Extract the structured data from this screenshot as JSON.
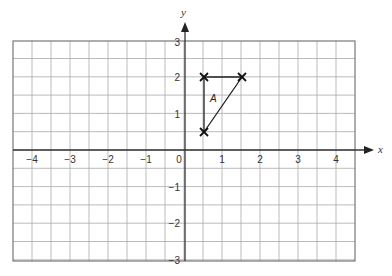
{
  "diagram": {
    "title": "",
    "x_axis": {
      "label": "x",
      "ticks": [
        "-4",
        "-3",
        "-2",
        "-1",
        "0",
        "1",
        "2",
        "3",
        "4"
      ],
      "range": [
        -5,
        4.5
      ]
    },
    "y_axis": {
      "label": "y",
      "ticks": [
        "3",
        "2",
        "1",
        "-1",
        "-2",
        "-3"
      ],
      "range": [
        -3,
        3
      ]
    },
    "grid_step": 0.5,
    "shape": {
      "label": "A",
      "vertices": [
        [
          0.5,
          2
        ],
        [
          1.5,
          2
        ],
        [
          0.5,
          0.5
        ]
      ],
      "vertex_marker": "cross"
    }
  },
  "chart_data": {
    "type": "scatter",
    "title": "",
    "xlabel": "x",
    "ylabel": "y",
    "xlim": [
      -5,
      4.5
    ],
    "ylim": [
      -3,
      3
    ],
    "grid": true,
    "series": [
      {
        "name": "A",
        "x": [
          0.5,
          1.5,
          0.5
        ],
        "y": [
          2,
          2,
          0.5
        ],
        "closed_polygon": true
      }
    ]
  },
  "labels": {
    "x_ticks": [
      "−4",
      "−3",
      "−2",
      "−1",
      "0",
      "1",
      "2",
      "3",
      "4"
    ],
    "y_pos": [
      "3",
      "2",
      "1"
    ],
    "y_neg": [
      "−1",
      "−2",
      "−3"
    ],
    "x_axis": "x",
    "y_axis": "y",
    "shape": "A"
  }
}
